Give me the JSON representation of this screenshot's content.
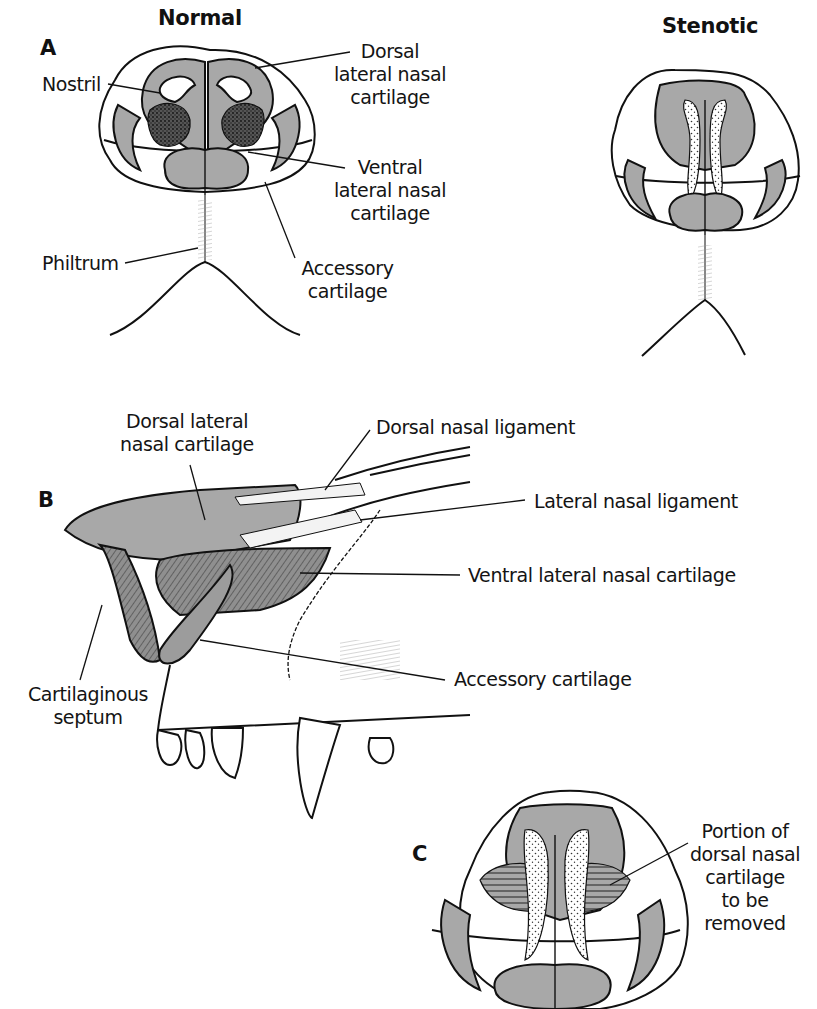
{
  "figure": {
    "fill_colors": {
      "cartilage": "#a8a8a8",
      "cartilage_dark": "#8f8f8f",
      "outline": "#111111",
      "background": "#ffffff"
    }
  },
  "panel_a": {
    "letter": "A",
    "normal": {
      "title": "Normal",
      "labels": {
        "nostril": "Nostril",
        "dorsal_lateral": [
          "Dorsal",
          "lateral nasal",
          "cartilage"
        ],
        "ventral_lateral": [
          "Ventral",
          "lateral nasal",
          "cartilage"
        ],
        "philtrum": "Philtrum",
        "accessory": [
          "Accessory",
          "cartilage"
        ]
      }
    },
    "stenotic": {
      "title": "Stenotic"
    }
  },
  "panel_b": {
    "letter": "B",
    "labels": {
      "dorsal_lateral": [
        "Dorsal lateral",
        "nasal cartilage"
      ],
      "dorsal_nasal_ligament": "Dorsal nasal ligament",
      "lateral_nasal_ligament": "Lateral nasal ligament",
      "ventral_lateral": "Ventral lateral nasal cartilage",
      "accessory": "Accessory cartilage",
      "septum": [
        "Cartilaginous",
        "septum"
      ]
    }
  },
  "panel_c": {
    "letter": "C",
    "labels": {
      "portion_removed": [
        "Portion of",
        "dorsal nasal",
        "cartilage",
        "to be",
        "removed"
      ]
    }
  }
}
